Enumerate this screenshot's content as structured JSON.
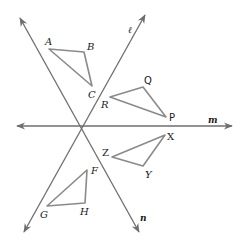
{
  "diagram": {
    "lines": [
      {
        "id": "l",
        "label": "ℓ"
      },
      {
        "id": "m",
        "label": "m"
      },
      {
        "id": "n",
        "label": "n"
      }
    ],
    "triangles": [
      {
        "id": "ABC",
        "vertices": [
          "A",
          "B",
          "C"
        ]
      },
      {
        "id": "PQR",
        "vertices": [
          "P",
          "Q",
          "R"
        ]
      },
      {
        "id": "XYZ",
        "vertices": [
          "X",
          "Y",
          "Z"
        ]
      },
      {
        "id": "FGH",
        "vertices": [
          "F",
          "G",
          "H"
        ]
      }
    ],
    "vertex_labels": {
      "A": "A",
      "B": "B",
      "C": "C",
      "P": "P",
      "Q": "Q",
      "R": "R",
      "X": "X",
      "Y": "Y",
      "Z": "Z",
      "F": "F",
      "G": "G",
      "H": "H"
    },
    "colors": {
      "line": "#6e6e6e",
      "triangle": "#8a8a8a",
      "text": "#1a1a1a"
    }
  }
}
